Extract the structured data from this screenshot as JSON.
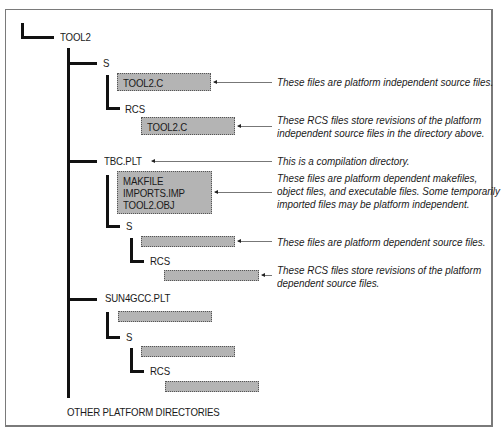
{
  "diagram": {
    "root": "TOOL2",
    "nodes": {
      "tool2_s": "S",
      "tool2_s_file": "TOOL2.C",
      "tool2_s_rcs": "RCS",
      "tool2_s_rcs_file": "TOOL2.C",
      "tbc": "TBC.PLT",
      "tbc_files": [
        "MAKFILE",
        "IMPORTS.IMP",
        "TOOL2.OBJ"
      ],
      "tbc_s": "S",
      "tbc_s_rcs": "RCS",
      "sun": "SUN4GCC.PLT",
      "sun_s": "S",
      "sun_s_rcs": "RCS",
      "other": "OTHER PLATFORM DIRECTORIES"
    },
    "notes": {
      "n1": [
        "These files are platform independent source files."
      ],
      "n2": [
        "These RCS files store revisions of the platform",
        "independent source files in the directory above."
      ],
      "n3": [
        "This is a compilation directory."
      ],
      "n4": [
        "These files are platform dependent makefiles,",
        "object files, and executable files. Some temporarily",
        "imported files may be platform independent."
      ],
      "n5": [
        "These files are platform dependent source files."
      ],
      "n6": [
        "These RCS files store revisions of the platform",
        "dependent source files."
      ]
    }
  }
}
